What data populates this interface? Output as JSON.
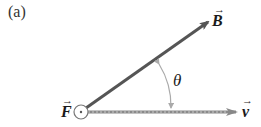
{
  "panel_label": "(a)",
  "vectors": {
    "B": {
      "label": "B",
      "color": "#555555"
    },
    "v": {
      "label": "v",
      "color": "#888888"
    },
    "F": {
      "label": "F",
      "symbol": "out-of-page (dot in circle)"
    }
  },
  "angle": {
    "label": "θ",
    "color": "#aaaaaa"
  },
  "arrow_glyph": "→"
}
